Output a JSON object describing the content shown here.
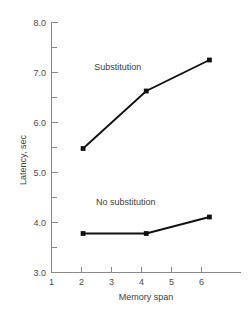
{
  "chart_data": {
    "type": "line",
    "title": "",
    "xlabel": "Memory span",
    "ylabel": "Latency, sec",
    "xlim": [
      1,
      7
    ],
    "ylim": [
      3.0,
      8.0
    ],
    "grid": false,
    "legend_position": "inline-annotation",
    "x_ticks": [
      1,
      2,
      3,
      4,
      5,
      6
    ],
    "x_tick_labels": [
      "1",
      "2",
      "3",
      "4",
      "5",
      "6"
    ],
    "y_ticks": [
      3.0,
      4.0,
      5.0,
      6.0,
      7.0,
      8.0
    ],
    "y_tick_labels": [
      "3.0",
      "4.0",
      "5.0",
      "6.0",
      "7.0",
      "8.0"
    ],
    "y_minor_ticks": [
      3.5,
      4.5,
      5.5,
      6.5,
      7.5
    ],
    "x": [
      2,
      4,
      6
    ],
    "series": [
      {
        "name": "Substitution",
        "values": [
          5.48,
          6.63,
          7.25
        ],
        "annotation": "Substitution",
        "annotation_x": 3.1,
        "annotation_y": 7.05,
        "color": "#111111"
      },
      {
        "name": "No substitution",
        "values": [
          3.78,
          3.78,
          4.11
        ],
        "annotation": "No substitution",
        "annotation_x": 3.35,
        "annotation_y": 4.35,
        "color": "#111111"
      }
    ]
  }
}
